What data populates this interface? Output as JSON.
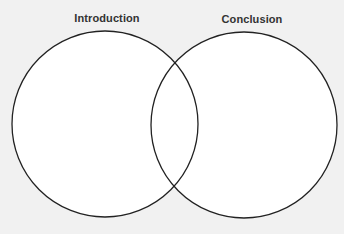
{
  "diagram": {
    "type": "venn",
    "sets": [
      {
        "id": "left",
        "label": "Introduction"
      },
      {
        "id": "right",
        "label": "Conclusion"
      }
    ],
    "regions": {
      "left_only": "",
      "intersection": "",
      "right_only": ""
    }
  },
  "colors": {
    "background": "#f1f1f1",
    "circle_fill": "#ffffff",
    "circle_stroke": "#222222",
    "label_text": "#333333"
  }
}
